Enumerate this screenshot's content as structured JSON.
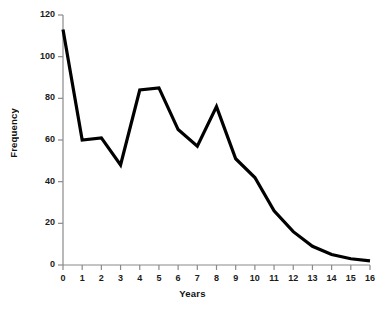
{
  "chart_data": {
    "type": "line",
    "title": "",
    "xlabel": "Years",
    "ylabel": "Frequency",
    "x": [
      0,
      1,
      2,
      3,
      4,
      5,
      6,
      7,
      8,
      9,
      10,
      11,
      12,
      13,
      14,
      15,
      16
    ],
    "values": [
      113,
      60,
      61,
      48,
      84,
      85,
      65,
      57,
      76,
      51,
      42,
      26,
      16,
      9,
      5,
      3,
      2
    ],
    "series": [
      {
        "name": "Frequency",
        "values": [
          113,
          60,
          61,
          48,
          84,
          85,
          65,
          57,
          76,
          51,
          42,
          26,
          16,
          9,
          5,
          3,
          2
        ]
      }
    ],
    "xlim": [
      0,
      16
    ],
    "ylim": [
      0,
      120
    ],
    "xticks": [
      "0",
      "1",
      "2",
      "3",
      "4",
      "5",
      "6",
      "7",
      "8",
      "9",
      "10",
      "11",
      "12",
      "13",
      "14",
      "15",
      "16"
    ],
    "yticks": [
      "0",
      "20",
      "40",
      "60",
      "80",
      "100",
      "120"
    ],
    "ytick_values": [
      0,
      20,
      40,
      60,
      80,
      100,
      120
    ],
    "grid": false,
    "legend": "none",
    "line_color": "#000000",
    "background_color": "#ffffff",
    "axis_color": "#808080",
    "text_color": "#111111"
  }
}
